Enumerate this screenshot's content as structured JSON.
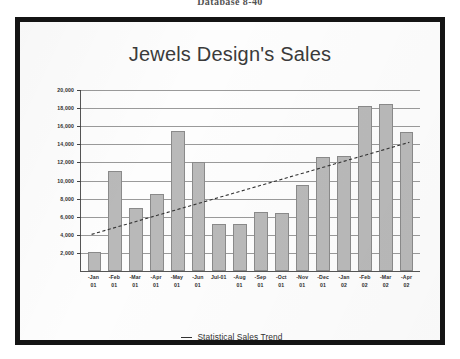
{
  "page": {
    "caption": "Database 8-40"
  },
  "slide": {
    "title": "Jewels Design's Sales"
  },
  "legend": {
    "position": "bottom",
    "items": [
      {
        "label": "Statistical Sales Trend",
        "marker": "dashed-line",
        "color": "#333333"
      }
    ]
  },
  "axis": {
    "y_ticks": [
      "20,000",
      "18,000",
      "16,000",
      "14,000",
      "12,000",
      "10,000",
      "8,000",
      "6,000",
      "4,000",
      "2,000"
    ],
    "x_labels": [
      {
        "line1": "-Jan",
        "line2": "01"
      },
      {
        "line1": "-Feb",
        "line2": "01"
      },
      {
        "line1": "-Mar",
        "line2": "01"
      },
      {
        "line1": "-Apr",
        "line2": "01"
      },
      {
        "line1": "-May",
        "line2": "01"
      },
      {
        "line1": "-Jun",
        "line2": "01"
      },
      {
        "line1": "Jul-01",
        "line2": ""
      },
      {
        "line1": "-Aug",
        "line2": "01"
      },
      {
        "line1": "-Sep",
        "line2": "01"
      },
      {
        "line1": "-Oct",
        "line2": "01"
      },
      {
        "line1": "-Nov",
        "line2": "01"
      },
      {
        "line1": "-Dec",
        "line2": "01"
      },
      {
        "line1": "-Jan",
        "line2": "02"
      },
      {
        "line1": "-Feb",
        "line2": "02"
      },
      {
        "line1": "-Mar",
        "line2": "02"
      },
      {
        "line1": "-Apr",
        "line2": "02"
      }
    ]
  },
  "colors": {
    "bar_fill": "#b9b9b9",
    "bar_stroke": "#8a8a8a",
    "grid": "#9a9a9a",
    "trend": "#333333",
    "frame": "#141414"
  },
  "chart_data": {
    "type": "bar",
    "title": "Jewels Design's Sales",
    "xlabel": "",
    "ylabel": "",
    "ylim": [
      0,
      20000
    ],
    "ytick_step": 2000,
    "grid": true,
    "legend_position": "bottom",
    "categories": [
      "Jan-01",
      "Feb-01",
      "Mar-01",
      "Apr-01",
      "May-01",
      "Jun-01",
      "Jul-01",
      "Aug-01",
      "Sep-01",
      "Oct-01",
      "Nov-01",
      "Dec-01",
      "Jan-02",
      "Feb-02",
      "Mar-02",
      "Apr-02"
    ],
    "values": [
      2100,
      11000,
      7000,
      8500,
      15500,
      12000,
      5200,
      5200,
      6500,
      6400,
      9500,
      12600,
      12700,
      18200,
      18400,
      15400
    ],
    "series": [
      {
        "name": "Monthly Sales",
        "type": "bar",
        "values": [
          2100,
          11000,
          7000,
          8500,
          15500,
          12000,
          5200,
          5200,
          6500,
          6400,
          9500,
          12600,
          12700,
          18200,
          18400,
          15400
        ]
      },
      {
        "name": "Statistical Sales Trend",
        "type": "line",
        "style": "dashed",
        "x_start_category": "Jan-01",
        "x_end_category": "Apr-02",
        "y_start": 4000,
        "y_end": 14200
      }
    ]
  }
}
